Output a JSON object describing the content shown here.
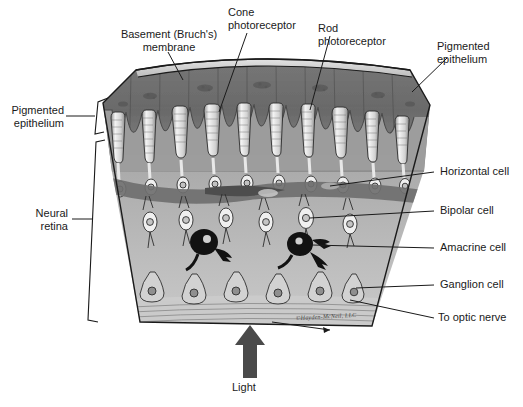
{
  "figure": {
    "title_alt": "Cross-section of the retina",
    "background_color": "#ffffff",
    "copyright": "©Hayden-McNeil, LLC"
  },
  "labels": {
    "basement_membrane": "Basement (Bruch's)\nmembrane",
    "cone_photoreceptor": "Cone\nphotoreceptor",
    "rod_photoreceptor": "Rod\nphotoreceptor",
    "pigmented_epithelium_top": "Pigmented\nepithelium",
    "pigmented_epithelium_left": "Pigmented\nepithelium",
    "neural_retina": "Neural\nretina",
    "horizontal_cell": "Horizontal cell",
    "bipolar_cell": "Bipolar cell",
    "amacrine_cell": "Amacrine cell",
    "ganglion_cell": "Ganglion cell",
    "to_optic_nerve": "To optic nerve",
    "light": "Light"
  },
  "colors": {
    "pigment_layer": "#6e6e6e",
    "pigment_layer_dark": "#5a5a5a",
    "neural_layer": "#b9b9b9",
    "neural_layer_mid": "#a6a6a6",
    "ganglion_layer": "#c6c6c6",
    "membrane_band": "#d8d8d8",
    "outline": "#1a1a1a",
    "cell_fill": "#f2f2f2",
    "amacrine_fill": "#111111",
    "arrow": "#4a4a4a",
    "leader_line": "#1a1a1a"
  },
  "anatomy": {
    "layers": [
      {
        "name": "Bruch's membrane",
        "tone": "#d8d8d8"
      },
      {
        "name": "Pigmented epithelium",
        "tone": "#6e6e6e"
      },
      {
        "name": "Photoreceptor layer",
        "tone": "#9a9a9a"
      },
      {
        "name": "Outer plexiform / horizontal layer",
        "tone": "#6b6b6b"
      },
      {
        "name": "Bipolar / amacrine layer",
        "tone": "#b9b9b9"
      },
      {
        "name": "Ganglion cell layer",
        "tone": "#c6c6c6"
      },
      {
        "name": "Optic nerve fiber layer",
        "tone": "#cfcfcf"
      }
    ],
    "photoreceptor_count": 12,
    "bipolar_count": 8,
    "amacrine_count": 2,
    "ganglion_count": 8,
    "light_direction": "upward"
  }
}
